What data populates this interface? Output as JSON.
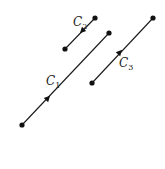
{
  "diagram": {
    "title": "",
    "background": "#ffffff",
    "stroke_color": "#1a1a1a",
    "curves": [
      {
        "id": "C1",
        "label_main": "C",
        "label_sub": "1",
        "start": [
          22,
          125
        ],
        "end": [
          109,
          33
        ],
        "arrow_at": [
          48,
          98
        ],
        "arrow_direction": "toward-end",
        "label_pos": [
          46,
          85
        ]
      },
      {
        "id": "C2",
        "label_main": "C",
        "label_sub": "2",
        "start": [
          95,
          18
        ],
        "end": [
          65,
          49
        ],
        "arrow_at": [
          82,
          31
        ],
        "arrow_direction": "toward-end",
        "label_pos": [
          73,
          26
        ]
      },
      {
        "id": "C3",
        "label_main": "C",
        "label_sub": "3",
        "start": [
          92,
          83
        ],
        "end": [
          153,
          18
        ],
        "arrow_at": [
          120,
          52
        ],
        "arrow_direction": "toward-end",
        "label_pos": [
          119,
          67
        ]
      }
    ]
  }
}
